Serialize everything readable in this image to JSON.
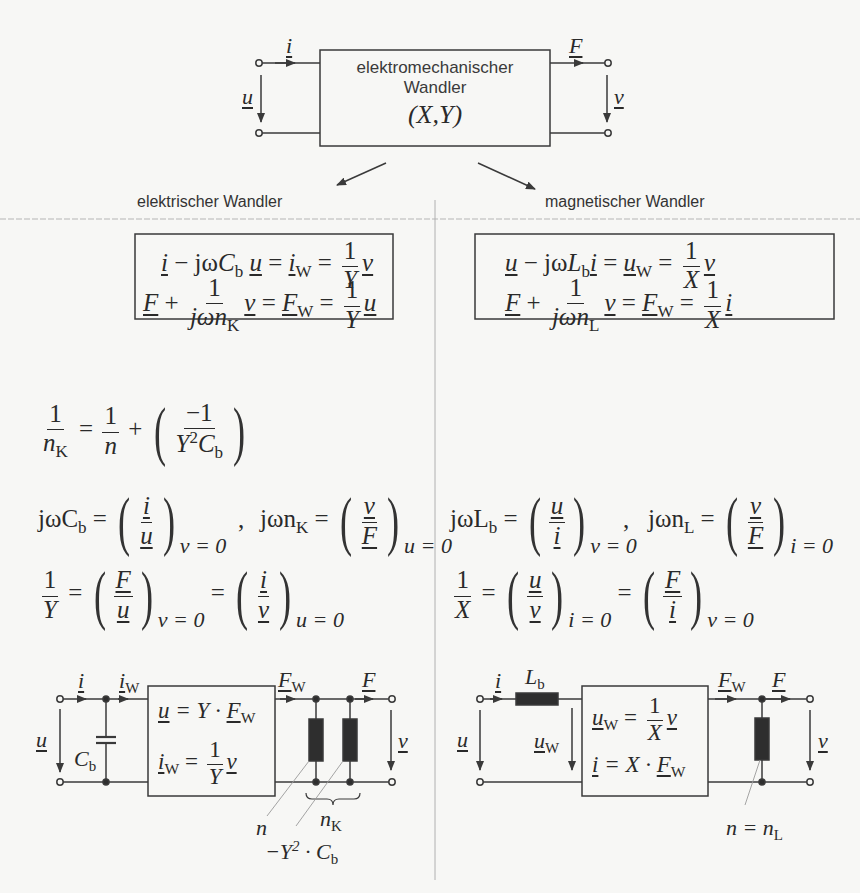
{
  "top": {
    "box_title_line1": "elektromechanischer",
    "box_title_line2": "Wandler",
    "box_params": "(X,Y)",
    "port_left_current": "i",
    "port_left_voltage": "u",
    "port_right_force": "F",
    "port_right_velocity": "v"
  },
  "left": {
    "heading": "elektrischer Wandler",
    "box_eq1": {
      "a": "i",
      "b": "jω",
      "c": "C",
      "c_sub": "b",
      "d": "u",
      "e": "i",
      "e_sub": "W",
      "f_num": "1",
      "f_den": "Y",
      "g": "v"
    },
    "box_eq2": {
      "a": "F",
      "b_num": "1",
      "b_den": "jωn",
      "b_den_sub": "K",
      "c": "v",
      "d": "F",
      "d_sub": "W",
      "e_num": "1",
      "e_den": "Y",
      "f": "u"
    },
    "eq_nK": {
      "lhs_num": "1",
      "lhs_den": "n",
      "lhs_den_sub": "K",
      "r1_num": "1",
      "r1_den": "n",
      "r2_num": "−1",
      "r2_den": "Y",
      "r2_den_sup": "2",
      "r2_den_c": "C",
      "r2_den_sub": "b"
    },
    "eq_jwCb": {
      "lhs": "jωC",
      "lhs_sub": "b",
      "num": "i",
      "den": "u",
      "cond": "v = 0"
    },
    "eq_jwnK": {
      "lhs": "jωn",
      "lhs_sub": "K",
      "num": "v",
      "den": "F",
      "cond": "u = 0"
    },
    "eq_Y": {
      "lhs_num": "1",
      "lhs_den": "Y",
      "a_num": "F",
      "a_den": "u",
      "a_cond": "v = 0",
      "b_num": "i",
      "b_den": "v",
      "b_cond": "u = 0"
    },
    "circuit": {
      "i": "i",
      "iW": "i",
      "iW_sub": "W",
      "u": "u",
      "Cb": "C",
      "Cb_sub": "b",
      "box_eq1": "u = Y · F",
      "box_eq1_sub": "W",
      "box_eq2_lhs": "i",
      "box_eq2_lhs_sub": "W",
      "box_eq2_num": "1",
      "box_eq2_den": "Y",
      "box_eq2_rhs": "v",
      "FW": "F",
      "FW_sub": "W",
      "F": "F",
      "v": "v",
      "label_n": "n",
      "label_nK": "n",
      "label_nK_sub": "K",
      "label_neg": "−Y",
      "label_neg_sup": "2",
      "label_neg_rest": " · C",
      "label_neg_sub": "b"
    }
  },
  "right": {
    "heading": "magnetischer Wandler",
    "box_eq1": {
      "a": "u",
      "b": "jω",
      "c": "L",
      "c_sub": "b",
      "d": "i",
      "e": "u",
      "e_sub": "W",
      "f_num": "1",
      "f_den": "X",
      "g": "v"
    },
    "box_eq2": {
      "a": "F",
      "b_num": "1",
      "b_den": "jωn",
      "b_den_sub": "L",
      "c": "v",
      "d": "F",
      "d_sub": "W",
      "e_num": "1",
      "e_den": "X",
      "f": "i"
    },
    "eq_jwLb": {
      "lhs": "jωL",
      "lhs_sub": "b",
      "num": "u",
      "den": "i",
      "cond": "v = 0"
    },
    "eq_jwnL": {
      "lhs": "jωn",
      "lhs_sub": "L",
      "num": "v",
      "den": "F",
      "cond": "i = 0"
    },
    "eq_X": {
      "lhs_num": "1",
      "lhs_den": "X",
      "a_num": "u",
      "a_den": "v",
      "a_cond": "i = 0",
      "b_num": "F",
      "b_den": "i",
      "b_cond": "v = 0"
    },
    "circuit": {
      "i": "i",
      "Lb": "L",
      "Lb_sub": "b",
      "u": "u",
      "uW": "u",
      "uW_sub": "W",
      "box_eq1_lhs": "u",
      "box_eq1_lhs_sub": "W",
      "box_eq1_num": "1",
      "box_eq1_den": "X",
      "box_eq1_rhs": "v",
      "box_eq2": "i = X · F",
      "box_eq2_sub": "W",
      "FW": "F",
      "FW_sub": "W",
      "F": "F",
      "v": "v",
      "label_n": "n = n",
      "label_n_sub": "L"
    }
  },
  "colors": {
    "line": "#3a3a3a",
    "background": "#f7f7f5",
    "element_fill": "#2e2e2e",
    "guide": "#9a9a9a"
  }
}
